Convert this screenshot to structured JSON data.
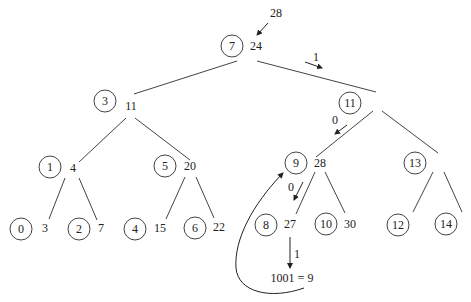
{
  "diagram": {
    "type": "binary-tree",
    "background": "#ffffff",
    "line_color": "#444444",
    "nodes": [
      {
        "id": "n7",
        "index": "7",
        "value": "24",
        "cx": 232,
        "cy": 46
      },
      {
        "id": "n3",
        "index": "3",
        "value": "11",
        "cx": 105,
        "cy": 100
      },
      {
        "id": "n11",
        "index": "11",
        "value": "",
        "cx": 350,
        "cy": 102
      },
      {
        "id": "n1",
        "index": "1",
        "value": "4",
        "cx": 50,
        "cy": 167
      },
      {
        "id": "n5",
        "index": "5",
        "value": "20",
        "cx": 165,
        "cy": 165
      },
      {
        "id": "n9",
        "index": "9",
        "value": "28",
        "cx": 296,
        "cy": 163
      },
      {
        "id": "n13",
        "index": "13",
        "value": "",
        "cx": 415,
        "cy": 162
      },
      {
        "id": "n0",
        "index": "0",
        "value": "3",
        "cx": 21,
        "cy": 228
      },
      {
        "id": "n2",
        "index": "2",
        "value": "7",
        "cx": 78,
        "cy": 228
      },
      {
        "id": "n4",
        "index": "4",
        "value": "15",
        "cx": 135,
        "cy": 228
      },
      {
        "id": "n6",
        "index": "6",
        "value": "22",
        "cx": 195,
        "cy": 227
      },
      {
        "id": "n8",
        "index": "8",
        "value": "27",
        "cx": 266,
        "cy": 224
      },
      {
        "id": "n10",
        "index": "10",
        "value": "30",
        "cx": 326,
        "cy": 224
      },
      {
        "id": "n12",
        "index": "12",
        "value": "",
        "cx": 398,
        "cy": 224
      },
      {
        "id": "n14",
        "index": "14",
        "value": "",
        "cx": 446,
        "cy": 223
      }
    ],
    "edges": [
      {
        "from": "n7",
        "to": "n3"
      },
      {
        "from": "n7",
        "to": "n11"
      },
      {
        "from": "n3",
        "to": "n1"
      },
      {
        "from": "n3",
        "to": "n5"
      },
      {
        "from": "n11",
        "to": "n9"
      },
      {
        "from": "n11",
        "to": "n13"
      },
      {
        "from": "n1",
        "to": "n0"
      },
      {
        "from": "n1",
        "to": "n2"
      },
      {
        "from": "n5",
        "to": "n4"
      },
      {
        "from": "n5",
        "to": "n6"
      },
      {
        "from": "n9",
        "to": "n8"
      },
      {
        "from": "n9",
        "to": "n10"
      },
      {
        "from": "n13",
        "to": "n12"
      },
      {
        "from": "n13",
        "to": "n14"
      }
    ],
    "annotations": {
      "query_value": "28",
      "bit_labels": [
        "1",
        "0",
        "0",
        "1"
      ],
      "result_label": "1001 = 9"
    }
  }
}
